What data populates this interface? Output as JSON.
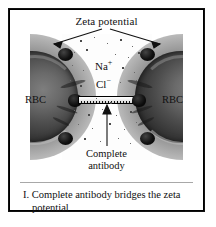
{
  "figure": {
    "title": "Zeta potential",
    "cell_label_left": "RBC",
    "cell_label_right": "RBC",
    "ion_cation": "Na",
    "ion_cation_charge": "+",
    "ion_anion": "Cl",
    "ion_anion_charge": "−",
    "antibody_label_line1": "Complete",
    "antibody_label_line2": "antibody",
    "icons": {
      "zeta_arrow_left": "arrow-down-left-icon",
      "zeta_arrow_right": "arrow-down-right-icon",
      "antibody_arrow": "arrow-up-icon"
    },
    "colors": {
      "border": "#111111",
      "halo_outer": "#e2e2e2",
      "halo_inner": "#4a4a4a",
      "cell_body": "#2b2b2b",
      "node": "#000000",
      "background": "#ffffff"
    }
  },
  "caption": {
    "line1": "I. Complete antibody bridges the zeta",
    "line2": "potential"
  }
}
